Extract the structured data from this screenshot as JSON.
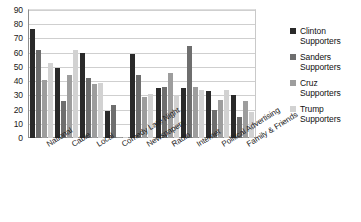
{
  "chart_data": {
    "type": "bar",
    "title": "",
    "xlabel": "",
    "ylabel": "",
    "ylim": [
      0,
      90
    ],
    "yticks": [
      0,
      10,
      20,
      30,
      40,
      50,
      60,
      70,
      80,
      90
    ],
    "grid": true,
    "legend_position": "right",
    "categories": [
      "National",
      "Cable",
      "Local",
      "Comedy Late Night",
      "Newspapers",
      "Radio",
      "Internet",
      "Political Advertising",
      "Family & Friends"
    ],
    "series": [
      {
        "name": "Clinton Supporters",
        "color": "#2a2a2a",
        "values": [
          77,
          49,
          60,
          19,
          59,
          35,
          35,
          33,
          30
        ]
      },
      {
        "name": "Sanders Supporters",
        "color": "#6e6e6e",
        "values": [
          62,
          26,
          42,
          23,
          44,
          36,
          65,
          20,
          15
        ]
      },
      {
        "name": "Cruz Supporters",
        "color": "#9d9d9d",
        "values": [
          41,
          44,
          38,
          1,
          29,
          46,
          36,
          27,
          26
        ]
      },
      {
        "name": "Trump Supporters",
        "color": "#d2d2d2",
        "values": [
          53,
          62,
          39,
          1,
          31,
          30,
          34,
          34,
          18
        ]
      }
    ]
  },
  "legend": {
    "entries": [
      "Clinton Supporters",
      "Sanders Supporters",
      "Cruz Supporters",
      "Trump Supporters"
    ]
  }
}
